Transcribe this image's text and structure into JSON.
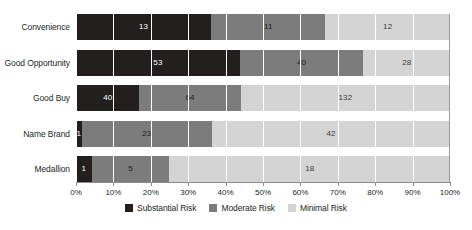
{
  "chart_data": {
    "type": "bar",
    "orientation": "horizontal",
    "stacked": true,
    "normalized": true,
    "title": "",
    "subtitle": "",
    "xlabel": "",
    "ylabel": "",
    "xlim": [
      0,
      100
    ],
    "grid": true,
    "legend_position": "bottom",
    "categories": [
      "Convenience",
      "Good Opportunity",
      "Good Buy",
      "Name Brand",
      "Medallion"
    ],
    "series": [
      {
        "name": "Substantial Risk",
        "color": "#231f1e",
        "values": [
          13,
          53,
          40,
          1,
          1
        ]
      },
      {
        "name": "Moderate Risk",
        "color": "#7c7c7c",
        "values": [
          11,
          40,
          64,
          23,
          5
        ]
      },
      {
        "name": "Minimal Risk",
        "color": "#d4d4d4",
        "values": [
          12,
          28,
          132,
          42,
          18
        ]
      }
    ],
    "row_totals": [
      36,
      121,
      236,
      66,
      24
    ],
    "xticks": [
      0,
      10,
      20,
      30,
      40,
      50,
      60,
      70,
      80,
      90,
      100
    ],
    "xticklabels": [
      "0%",
      "10%",
      "20%",
      "30%",
      "40%",
      "50%",
      "60%",
      "70%",
      "80%",
      "90%",
      "100%"
    ]
  },
  "legend": {
    "items": [
      {
        "label": "Substantial Risk",
        "color": "#231f1e"
      },
      {
        "label": "Moderate Risk",
        "color": "#7c7c7c"
      },
      {
        "label": "Minimal Risk",
        "color": "#d4d4d4"
      }
    ]
  },
  "colors": {
    "substantial_risk": "#231f1e",
    "moderate_risk": "#7c7c7c",
    "minimal_risk": "#d4d4d4",
    "axis": "#8c8c8c",
    "text": "#231f1e",
    "background": "#ffffff"
  }
}
